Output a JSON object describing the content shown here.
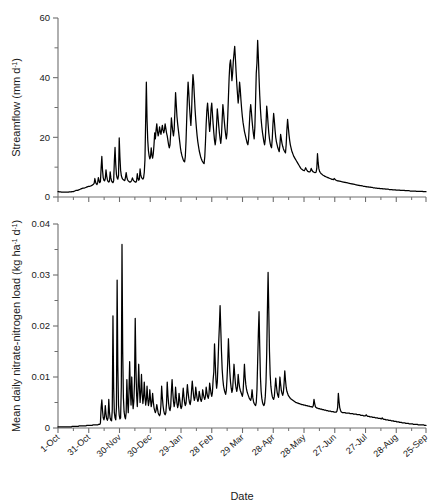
{
  "figure": {
    "xlabel": "Date",
    "background": "#ffffff",
    "line_color": "#000000",
    "axis_color": "#6e6e6e"
  },
  "chart_data": [
    {
      "type": "line",
      "panel": "top",
      "title": "",
      "xlabel": "",
      "ylabel": "Streamflow (mm d⁻¹)",
      "ylabel_parts": {
        "text": "Streamflow (mm d",
        "sup": "-1",
        "tail": ")"
      },
      "yticks": [
        0,
        20,
        40,
        60
      ],
      "ytick_labels": [
        "0",
        "20",
        "40",
        "60"
      ],
      "yminor": [
        10,
        30,
        50
      ],
      "ylim": [
        0,
        60
      ],
      "grid": false,
      "legend": "none",
      "xlim_days": [
        0,
        360
      ],
      "x_major_days": [
        0,
        30,
        60,
        90,
        120,
        150,
        180,
        210,
        240,
        270,
        300,
        330,
        359
      ],
      "x_tick_labels": [
        "1-Oct",
        "31-Oct",
        "30-Nov",
        "30-Dec",
        "29-Jan",
        "28 Feb",
        "29 Mar",
        "28-Apr",
        "28-May",
        "27-Jun",
        "27-Jul",
        "28-Aug",
        "25-Sep"
      ],
      "series_name": "Streamflow",
      "values": [
        1.8,
        1.8,
        1.7,
        1.7,
        1.7,
        1.6,
        1.6,
        1.6,
        1.6,
        1.6,
        1.6,
        1.6,
        1.6,
        1.6,
        1.6,
        1.6,
        1.7,
        1.7,
        1.7,
        1.7,
        1.8,
        1.8,
        1.8,
        1.9,
        2.0,
        2.1,
        2.2,
        2.2,
        2.2,
        2.3,
        2.4,
        2.5,
        2.6,
        2.7,
        2.8,
        2.9,
        3.0,
        3.0,
        3.0,
        3.1,
        3.2,
        3.3,
        3.4,
        3.5,
        3.6,
        3.6,
        3.6,
        3.7,
        3.8,
        3.9,
        4.1,
        4.3,
        4.6,
        6.2,
        5.0,
        4.4,
        4.2,
        4.8,
        6.5,
        5.5,
        4.8,
        5.2,
        9.8,
        13.6,
        9.0,
        6.5,
        5.6,
        5.4,
        6.2,
        9.1,
        7.0,
        5.8,
        5.2,
        5.0,
        5.3,
        8.4,
        6.4,
        5.4,
        5.0,
        4.8,
        5.4,
        12.0,
        16.6,
        11.0,
        7.6,
        6.4,
        6.0,
        7.2,
        19.8,
        13.5,
        9.0,
        7.2,
        6.4,
        6.0,
        5.8,
        5.6,
        5.5,
        6.6,
        8.2,
        6.6,
        5.8,
        5.4,
        5.2,
        5.0,
        5.0,
        5.2,
        5.6,
        6.4,
        5.8,
        5.4,
        5.2,
        5.0,
        5.0,
        5.4,
        7.8,
        6.2,
        5.6,
        6.0,
        9.4,
        7.4,
        6.6,
        6.2,
        6.0,
        6.4,
        8.2,
        12.5,
        25.5,
        38.5,
        26.0,
        19.0,
        15.5,
        13.8,
        12.8,
        13.5,
        16.5,
        14.2,
        13.0,
        14.5,
        17.5,
        21.5,
        19.5,
        22.5,
        24.5,
        22.0,
        20.5,
        21.5,
        23.5,
        22.0,
        21.0,
        22.5,
        24.0,
        22.5,
        21.5,
        22.5,
        24.5,
        23.0,
        21.5,
        20.5,
        19.0,
        17.5,
        16.5,
        17.5,
        21.5,
        26.5,
        24.0,
        22.0,
        20.5,
        22.5,
        28.5,
        35.0,
        31.0,
        27.0,
        24.5,
        22.5,
        20.5,
        18.5,
        16.5,
        15.0,
        14.0,
        13.2,
        12.5,
        12.0,
        11.8,
        13.5,
        18.5,
        26.0,
        33.0,
        38.5,
        35.0,
        30.5,
        27.0,
        24.0,
        28.5,
        36.0,
        41.0,
        38.5,
        34.0,
        29.5,
        26.0,
        23.0,
        20.5,
        18.5,
        17.0,
        15.5,
        14.5,
        13.5,
        12.8,
        12.2,
        11.8,
        11.4,
        11.2,
        13.5,
        18.5,
        24.5,
        29.0,
        31.5,
        28.5,
        25.0,
        22.0,
        24.5,
        29.5,
        31.5,
        28.0,
        24.5,
        21.5,
        19.0,
        17.5,
        19.5,
        24.5,
        29.5,
        27.0,
        24.0,
        21.5,
        19.5,
        18.0,
        20.5,
        26.0,
        31.0,
        28.5,
        25.5,
        23.0,
        21.0,
        19.5,
        21.5,
        27.0,
        33.5,
        40.0,
        44.5,
        46.0,
        43.0,
        39.0,
        41.5,
        45.5,
        48.0,
        50.5,
        46.5,
        42.0,
        38.0,
        34.5,
        31.5,
        34.0,
        38.5,
        36.0,
        32.5,
        29.5,
        27.0,
        25.0,
        23.5,
        22.0,
        21.0,
        20.0,
        19.0,
        18.0,
        17.5,
        19.5,
        24.0,
        28.5,
        31.0,
        28.5,
        25.5,
        23.0,
        21.0,
        19.5,
        23.5,
        32.0,
        41.5,
        45.0,
        52.5,
        47.0,
        40.0,
        34.0,
        29.5,
        26.0,
        23.5,
        21.5,
        20.0,
        18.5,
        17.5,
        19.5,
        24.0,
        30.5,
        28.0,
        24.5,
        21.5,
        19.5,
        18.0,
        17.0,
        16.5,
        19.5,
        24.5,
        28.0,
        25.5,
        22.5,
        20.0,
        18.5,
        17.5,
        16.5,
        15.8,
        15.2,
        17.5,
        21.0,
        19.5,
        18.0,
        17.0,
        16.2,
        15.6,
        15.2,
        14.8,
        17.5,
        22.5,
        26.0,
        23.5,
        21.0,
        19.0,
        17.5,
        16.5,
        15.5,
        14.8,
        14.2,
        13.6,
        13.2,
        12.8,
        12.4,
        12.0,
        11.6,
        11.2,
        10.8,
        10.4,
        10.0,
        9.6,
        9.4,
        9.2,
        9.0,
        8.9,
        8.8,
        9.2,
        9.8,
        9.3,
        8.9,
        8.6,
        8.5,
        8.4,
        8.4,
        8.8,
        9.6,
        9.0,
        8.6,
        8.4,
        8.3,
        8.2,
        8.2,
        8.3,
        9.5,
        14.5,
        11.5,
        9.5,
        8.6,
        8.2,
        7.9,
        7.7,
        7.5,
        7.3,
        7.2,
        7.0,
        6.9,
        6.8,
        6.7,
        6.6,
        6.5,
        6.4,
        6.3,
        6.2,
        6.1,
        6.0,
        5.9,
        5.9,
        5.8,
        6.2,
        6.0,
        5.7,
        5.6,
        5.5,
        5.4,
        5.4,
        5.3,
        5.3,
        5.2,
        5.2,
        5.1,
        5.1,
        5.0,
        5.0,
        4.9,
        4.9,
        4.8,
        4.8,
        4.7,
        4.7,
        4.6,
        4.6,
        4.5,
        4.5,
        4.4,
        4.4,
        4.3,
        4.3,
        4.2,
        4.2,
        4.1,
        4.1,
        4.0,
        4.0,
        3.9,
        3.9,
        3.8,
        3.8,
        3.8,
        3.7,
        3.7,
        3.6,
        3.6,
        3.6,
        3.5,
        3.5,
        3.4,
        3.4,
        3.4,
        3.3,
        3.3,
        3.3,
        3.2,
        3.2,
        3.2,
        3.1,
        3.1,
        3.1,
        3.0,
        3.0,
        3.0,
        2.9,
        2.9,
        2.9,
        2.9,
        2.8,
        2.8,
        2.8,
        2.8,
        2.7,
        2.7,
        2.7,
        2.7,
        2.6,
        2.6,
        2.6,
        2.6,
        2.6,
        2.5,
        2.5,
        2.5,
        2.5,
        2.5,
        2.4,
        2.4,
        2.4,
        2.4,
        2.4,
        2.3,
        2.3,
        2.3,
        2.3,
        2.3,
        2.3,
        2.2,
        2.2,
        2.2,
        2.2,
        2.2,
        2.2,
        2.2,
        2.1,
        2.1,
        2.1,
        2.1,
        2.1,
        2.1,
        2.1,
        2.0,
        2.0,
        2.0,
        2.0,
        2.0,
        2.0,
        2.0,
        2.0,
        2.0,
        1.9,
        1.9,
        1.9,
        1.9,
        1.9,
        1.9,
        1.9,
        1.9,
        1.9,
        1.9,
        1.8,
        1.8,
        1.8,
        1.8,
        1.8
      ]
    },
    {
      "type": "line",
      "panel": "bottom",
      "title": "",
      "xlabel": "Date",
      "ylabel": "Mean daily nitrate-nitrogen load (kg ha⁻¹ d⁻¹)",
      "ylabel_parts": {
        "text": "Mean daily nitrate-nitrogen load (kg ha",
        "sup1": "-1",
        "mid": " d",
        "sup2": "-1",
        "tail": ")"
      },
      "yticks": [
        0,
        0.01,
        0.02,
        0.03,
        0.04
      ],
      "ytick_labels": [
        "0",
        "0.01",
        "0.02",
        "0.03",
        "0.04"
      ],
      "yminor": [
        0.005,
        0.015,
        0.025,
        0.035
      ],
      "ylim": [
        0,
        0.04
      ],
      "grid": false,
      "legend": "none",
      "xlim_days": [
        0,
        360
      ],
      "x_major_days": [
        0,
        30,
        60,
        90,
        120,
        150,
        180,
        210,
        240,
        270,
        300,
        330,
        359
      ],
      "x_tick_labels": [
        "1-Oct",
        "31-Oct",
        "30-Nov",
        "30-Dec",
        "29-Jan",
        "28 Feb",
        "29 Mar",
        "28-Apr",
        "28-May",
        "27-Jun",
        "27-Jul",
        "28-Aug",
        "25-Sep"
      ],
      "series_name": "Mean daily nitrate-nitrogen load",
      "values": [
        0.0002,
        0.0002,
        0.0002,
        0.0002,
        0.0002,
        0.0002,
        0.0002,
        0.0002,
        0.0002,
        0.0002,
        0.0002,
        0.0002,
        0.0002,
        0.0002,
        0.0002,
        0.0002,
        0.0002,
        0.0002,
        0.0002,
        0.0002,
        0.0003,
        0.0003,
        0.0003,
        0.0003,
        0.0003,
        0.0003,
        0.0003,
        0.0003,
        0.0003,
        0.0003,
        0.0004,
        0.0004,
        0.0004,
        0.0004,
        0.0004,
        0.0004,
        0.0004,
        0.0004,
        0.0004,
        0.0004,
        0.0004,
        0.0005,
        0.0005,
        0.0005,
        0.0005,
        0.0005,
        0.0005,
        0.0005,
        0.0005,
        0.0005,
        0.0006,
        0.0006,
        0.0006,
        0.0006,
        0.0006,
        0.0006,
        0.0006,
        0.0006,
        0.0007,
        0.0007,
        0.0007,
        0.001,
        0.004,
        0.0055,
        0.0034,
        0.002,
        0.0016,
        0.0022,
        0.0044,
        0.0028,
        0.0018,
        0.0015,
        0.002,
        0.0056,
        0.003,
        0.0019,
        0.0015,
        0.0014,
        0.0035,
        0.022,
        0.008,
        0.003,
        0.002,
        0.0016,
        0.004,
        0.029,
        0.012,
        0.0045,
        0.0025,
        0.0018,
        0.002,
        0.008,
        0.036,
        0.015,
        0.006,
        0.0032,
        0.0022,
        0.0018,
        0.003,
        0.0095,
        0.005,
        0.003,
        0.007,
        0.013,
        0.0075,
        0.0045,
        0.01,
        0.006,
        0.0038,
        0.0052,
        0.009,
        0.0215,
        0.012,
        0.0065,
        0.0042,
        0.0075,
        0.0125,
        0.008,
        0.005,
        0.007,
        0.0105,
        0.0068,
        0.0048,
        0.006,
        0.009,
        0.0062,
        0.0045,
        0.0055,
        0.0082,
        0.0058,
        0.0044,
        0.0052,
        0.0075,
        0.0056,
        0.0042,
        0.005,
        0.0068,
        0.0052,
        0.004,
        0.0034,
        0.003,
        0.0035,
        0.0046,
        0.0038,
        0.003,
        0.0026,
        0.0024,
        0.0028,
        0.0046,
        0.0082,
        0.006,
        0.0044,
        0.0034,
        0.0028,
        0.0026,
        0.003,
        0.0048,
        0.009,
        0.0065,
        0.0048,
        0.0038,
        0.0034,
        0.0042,
        0.0072,
        0.0095,
        0.007,
        0.0052,
        0.0042,
        0.005,
        0.008,
        0.0062,
        0.0048,
        0.004,
        0.0046,
        0.0068,
        0.0056,
        0.0044,
        0.0038,
        0.0042,
        0.006,
        0.0078,
        0.0062,
        0.005,
        0.0044,
        0.0048,
        0.0066,
        0.0085,
        0.007,
        0.0058,
        0.005,
        0.0046,
        0.0054,
        0.0074,
        0.0092,
        0.0076,
        0.0062,
        0.0054,
        0.006,
        0.008,
        0.0068,
        0.0058,
        0.0052,
        0.0056,
        0.0072,
        0.0064,
        0.0056,
        0.0052,
        0.0058,
        0.0075,
        0.0066,
        0.006,
        0.0056,
        0.0062,
        0.008,
        0.007,
        0.0062,
        0.0058,
        0.0066,
        0.0088,
        0.0078,
        0.0068,
        0.0062,
        0.007,
        0.0095,
        0.011,
        0.0165,
        0.013,
        0.0095,
        0.0078,
        0.009,
        0.0125,
        0.0168,
        0.02,
        0.024,
        0.0195,
        0.015,
        0.0115,
        0.0095,
        0.0082,
        0.0075,
        0.007,
        0.0066,
        0.0074,
        0.0098,
        0.013,
        0.0175,
        0.014,
        0.011,
        0.009,
        0.0078,
        0.007,
        0.0076,
        0.0098,
        0.0125,
        0.0105,
        0.0088,
        0.0078,
        0.0072,
        0.008,
        0.0105,
        0.009,
        0.008,
        0.0074,
        0.007,
        0.0066,
        0.0062,
        0.007,
        0.0095,
        0.0125,
        0.01,
        0.0085,
        0.0076,
        0.007,
        0.0066,
        0.0062,
        0.0058,
        0.0056,
        0.0054,
        0.006,
        0.0075,
        0.006,
        0.0052,
        0.0048,
        0.0046,
        0.0044,
        0.005,
        0.0075,
        0.013,
        0.0185,
        0.0228,
        0.016,
        0.01,
        0.0072,
        0.0058,
        0.005,
        0.0046,
        0.0044,
        0.0048,
        0.0062,
        0.009,
        0.0145,
        0.023,
        0.0305,
        0.023,
        0.015,
        0.0105,
        0.0082,
        0.007,
        0.0062,
        0.0058,
        0.0056,
        0.0062,
        0.008,
        0.0098,
        0.0082,
        0.007,
        0.0064,
        0.006,
        0.0075,
        0.01,
        0.0086,
        0.0074,
        0.0068,
        0.0064,
        0.007,
        0.0088,
        0.0112,
        0.0094,
        0.008,
        0.0072,
        0.0068,
        0.0064,
        0.0062,
        0.006,
        0.0058,
        0.0057,
        0.0056,
        0.0055,
        0.0054,
        0.0053,
        0.0052,
        0.0051,
        0.005,
        0.005,
        0.0049,
        0.0049,
        0.0048,
        0.0048,
        0.0047,
        0.0047,
        0.0046,
        0.0046,
        0.0046,
        0.0045,
        0.0045,
        0.0045,
        0.0044,
        0.0044,
        0.0044,
        0.0043,
        0.0043,
        0.0043,
        0.0042,
        0.0042,
        0.0042,
        0.0041,
        0.0041,
        0.0044,
        0.0056,
        0.0048,
        0.0042,
        0.004,
        0.0039,
        0.0039,
        0.0038,
        0.0038,
        0.0038,
        0.0037,
        0.0037,
        0.0037,
        0.0036,
        0.0036,
        0.0036,
        0.0035,
        0.0035,
        0.0035,
        0.0034,
        0.0034,
        0.0034,
        0.0033,
        0.0033,
        0.0033,
        0.0033,
        0.0032,
        0.0032,
        0.0032,
        0.0032,
        0.0031,
        0.0031,
        0.0031,
        0.0031,
        0.0033,
        0.004,
        0.0068,
        0.0052,
        0.004,
        0.0035,
        0.0032,
        0.0031,
        0.003,
        0.003,
        0.003,
        0.003,
        0.003,
        0.0029,
        0.0029,
        0.0029,
        0.0029,
        0.0029,
        0.0029,
        0.0028,
        0.0028,
        0.0028,
        0.0028,
        0.0028,
        0.0027,
        0.0027,
        0.0027,
        0.0027,
        0.0027,
        0.0026,
        0.0026,
        0.0026,
        0.0026,
        0.0026,
        0.0025,
        0.0025,
        0.0025,
        0.0025,
        0.0024,
        0.0024,
        0.0024,
        0.0024,
        0.0026,
        0.0024,
        0.0023,
        0.0023,
        0.0023,
        0.0022,
        0.0022,
        0.0022,
        0.0022,
        0.0021,
        0.0021,
        0.0021,
        0.0021,
        0.002,
        0.002,
        0.002,
        0.002,
        0.0019,
        0.0019,
        0.0019,
        0.0019,
        0.0018,
        0.0018,
        0.002,
        0.0018,
        0.0017,
        0.0017,
        0.0017,
        0.0016,
        0.0016,
        0.0016,
        0.0016,
        0.0015,
        0.0015,
        0.0015,
        0.0015,
        0.0014,
        0.0014,
        0.0014,
        0.0014,
        0.0013,
        0.0013,
        0.0013,
        0.0013,
        0.0012,
        0.0012,
        0.0012,
        0.0012,
        0.0011,
        0.0011,
        0.0011,
        0.0011,
        0.001,
        0.001,
        0.001,
        0.001,
        0.001,
        0.0009,
        0.0009,
        0.0009,
        0.0009,
        0.0009,
        0.0008,
        0.0008,
        0.0008,
        0.0008,
        0.0008,
        0.0008,
        0.0007,
        0.0007,
        0.0007,
        0.0007,
        0.0007,
        0.0007,
        0.0007,
        0.0006,
        0.0006,
        0.0006,
        0.0006,
        0.0006,
        0.0006,
        0.0006,
        0.0006,
        0.0006,
        0.0005,
        0.0005,
        0.0005
      ]
    }
  ]
}
